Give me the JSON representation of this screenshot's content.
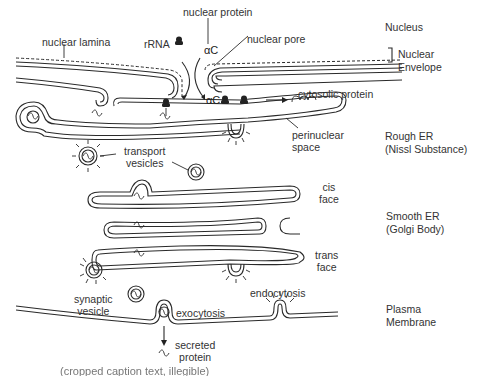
{
  "diagram": {
    "type": "cell-biology-schematic",
    "labels": {
      "nuclear_protein": "nuclear protein",
      "nuclear_lamina": "nuclear lamina",
      "rrna": "rRNA",
      "nuclear_pore": "nuclear pore",
      "cytosolic_protein": "cytosolic protein",
      "perinuclear_space": [
        "perinuclear",
        "space"
      ],
      "transport_vesicles": [
        "transport",
        "vesicles"
      ],
      "cis_face": [
        "cis",
        "face"
      ],
      "trans_face": [
        "trans",
        "face"
      ],
      "synaptic_vesicle": [
        "synaptic",
        "vesicle"
      ],
      "endocytosis": "endocytosis",
      "exocytosis": "exocytosis",
      "secreted_protein": [
        "secreted",
        "protein"
      ]
    },
    "regions": [
      {
        "id": "nucleus",
        "lines": [
          "Nucleus"
        ]
      },
      {
        "id": "nuclear-envelope",
        "lines": [
          "Nuclear",
          "Envelope"
        ],
        "bracket": true
      },
      {
        "id": "rough-er",
        "lines": [
          "Rough ER",
          "(Nissl Substance)"
        ]
      },
      {
        "id": "smooth-er",
        "lines": [
          "Smooth ER",
          "(Golgi Body)"
        ]
      },
      {
        "id": "plasma-membrane",
        "lines": [
          "Plasma",
          "Membrane"
        ]
      }
    ],
    "caption_cropped": "(cropped caption text, illegible)"
  }
}
